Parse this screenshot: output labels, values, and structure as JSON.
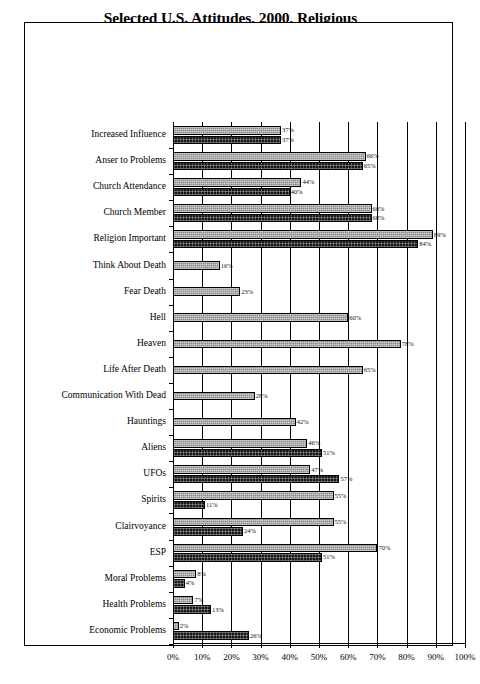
{
  "chart_data": {
    "type": "bar",
    "orientation": "horizontal",
    "title": "Selected U.S. Attitudes, 2000, Religious Beliefs, Death Attitudes, Paranormal Phenomenon and Issues of Concern",
    "title_lines": [
      "Selected U.S. Attitudes, 2000, Religious",
      "Beliefs, Death Attitudes, Paranormal",
      "Phenomenon and Issues of Concern"
    ],
    "xlabel": "",
    "ylabel": "",
    "xlim": [
      0,
      100
    ],
    "xtick_labels": [
      "0%",
      "10%",
      "20%",
      "30%",
      "40%",
      "50%",
      "60%",
      "70%",
      "80%",
      "90%",
      "100%"
    ],
    "xticks": [
      0,
      10,
      20,
      30,
      40,
      50,
      60,
      70,
      80,
      90,
      100
    ],
    "grid": true,
    "legend": "none",
    "value_suffix": "%",
    "categories": [
      "Increased Influence",
      "Anser to Problems",
      "Church Attendance",
      "Church Member",
      "Religion Important",
      "Think About Death",
      "Fear Death",
      "Hell",
      "Heaven",
      "Life After Death",
      "Communication With Dead",
      "Hauntings",
      "Aliens",
      "UFOs",
      "Spirits",
      "Clairvoyance",
      "ESP",
      "Moral Problems",
      "Health Problems",
      "Economic Problems"
    ],
    "series": [
      {
        "name": "series-light",
        "color": "#8a8a8a",
        "values": [
          37,
          66,
          44,
          68,
          89,
          16,
          23,
          60,
          78,
          65,
          28,
          42,
          46,
          47,
          55,
          55,
          70,
          8,
          7,
          2
        ],
        "labels": [
          "37%",
          "66%",
          "44%",
          "68%",
          "89%",
          "16%",
          "23%",
          "60%",
          "78%",
          "65%",
          "28%",
          "42%",
          "46%",
          "47%",
          "55%",
          "55%",
          "70%",
          "8%",
          "7%",
          "2%"
        ]
      },
      {
        "name": "series-dark",
        "color": "#171717",
        "values": [
          37,
          65,
          40,
          68,
          84,
          null,
          null,
          null,
          null,
          null,
          null,
          null,
          51,
          57,
          11,
          24,
          51,
          4,
          13,
          26
        ],
        "labels": [
          "37%",
          "65%",
          "40%",
          "68%",
          "84%",
          "",
          "",
          "",
          "",
          "",
          "",
          "",
          "51%",
          "57%",
          "11%",
          "24%",
          "51%",
          "4%",
          "13%",
          "26%"
        ]
      }
    ]
  }
}
